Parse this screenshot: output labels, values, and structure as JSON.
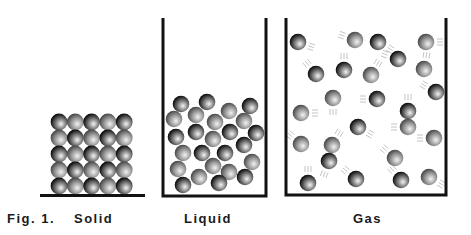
{
  "figure": {
    "caption_prefix": "Fig. 1.",
    "panels": [
      {
        "id": "solid",
        "label": "Solid"
      },
      {
        "id": "liquid",
        "label": "Liquid"
      },
      {
        "id": "gas",
        "label": "Gas"
      }
    ]
  },
  "colors": {
    "container": "#111111",
    "dark_ball_edge": "#0a0a0a",
    "light_ball_edge": "#5a5a5a",
    "highlight": "#f2f2f2",
    "motion_lines": "#bdbdbd"
  },
  "solid": {
    "rows": 5,
    "cols": 5,
    "pattern": [
      [
        "D",
        "L",
        "D",
        "L",
        "D"
      ],
      [
        "L",
        "D",
        "L",
        "D",
        "L"
      ],
      [
        "D",
        "L",
        "D",
        "L",
        "D"
      ],
      [
        "L",
        "D",
        "L",
        "D",
        "L"
      ],
      [
        "D",
        "L",
        "D",
        "L",
        "D"
      ]
    ]
  },
  "liquid": {
    "particles": [
      [
        181,
        104,
        "D"
      ],
      [
        207,
        102,
        "D"
      ],
      [
        250,
        106,
        "D"
      ],
      [
        229,
        111,
        "L"
      ],
      [
        196,
        115,
        "L"
      ],
      [
        174,
        119,
        "L"
      ],
      [
        215,
        122,
        "L"
      ],
      [
        244,
        121,
        "L"
      ],
      [
        196,
        132,
        "D"
      ],
      [
        230,
        132,
        "D"
      ],
      [
        176,
        137,
        "D"
      ],
      [
        256,
        133,
        "D"
      ],
      [
        213,
        139,
        "L"
      ],
      [
        244,
        145,
        "D"
      ],
      [
        183,
        153,
        "L"
      ],
      [
        202,
        153,
        "D"
      ],
      [
        225,
        153,
        "D"
      ],
      [
        252,
        162,
        "L"
      ],
      [
        213,
        166,
        "L"
      ],
      [
        178,
        169,
        "L"
      ],
      [
        229,
        172,
        "L"
      ],
      [
        199,
        177,
        "L"
      ],
      [
        245,
        177,
        "D"
      ],
      [
        183,
        185,
        "D"
      ],
      [
        219,
        183,
        "D"
      ]
    ]
  },
  "gas": {
    "particles": [
      [
        298,
        42,
        "D",
        20
      ],
      [
        355,
        40,
        "L",
        200
      ],
      [
        378,
        42,
        "D",
        30
      ],
      [
        426,
        42,
        "L",
        0
      ],
      [
        398,
        59,
        "D",
        200
      ],
      [
        316,
        74,
        "D",
        230
      ],
      [
        344,
        70,
        "D",
        270
      ],
      [
        371,
        75,
        "L",
        300
      ],
      [
        424,
        69,
        "L",
        280
      ],
      [
        333,
        98,
        "L",
        90
      ],
      [
        377,
        99,
        "D",
        180
      ],
      [
        436,
        92,
        "D",
        210
      ],
      [
        301,
        113,
        "L",
        0
      ],
      [
        408,
        111,
        "D",
        270
      ],
      [
        408,
        127,
        "L",
        180
      ],
      [
        358,
        127,
        "D",
        30
      ],
      [
        301,
        144,
        "L",
        220
      ],
      [
        332,
        145,
        "L",
        300
      ],
      [
        434,
        138,
        "L",
        180
      ],
      [
        329,
        161,
        "D",
        110
      ],
      [
        395,
        158,
        "L",
        220
      ],
      [
        308,
        183,
        "D",
        270
      ],
      [
        356,
        179,
        "D",
        220
      ],
      [
        401,
        180,
        "D",
        230
      ],
      [
        429,
        177,
        "L",
        30
      ]
    ]
  }
}
